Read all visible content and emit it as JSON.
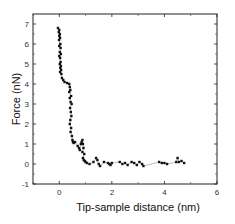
{
  "chart_data": {
    "type": "scatter",
    "title": "",
    "xlabel": "Tip-sample distance (nm)",
    "ylabel": "Force (nN)",
    "xlim": [
      -1,
      6
    ],
    "ylim": [
      -1,
      7.5
    ],
    "x_ticks": [
      0,
      2,
      4,
      6
    ],
    "x_minor_ticks": [
      -1,
      1,
      3,
      5
    ],
    "y_ticks": [
      -1,
      0,
      1,
      2,
      3,
      4,
      5,
      6,
      7
    ],
    "grid": false,
    "legend": null,
    "series": [
      {
        "name": "force-distance",
        "marker": "square",
        "line": "thin dotted connecting line",
        "x": [
          -0.05,
          0.0,
          -0.02,
          0.02,
          0.0,
          0.03,
          -0.01,
          0.04,
          0.0,
          0.05,
          0.02,
          0.06,
          0.0,
          0.03,
          0.05,
          0.02,
          0.06,
          0.04,
          0.07,
          0.03,
          0.08,
          0.1,
          0.15,
          0.2,
          0.3,
          0.38,
          0.4,
          0.42,
          0.38,
          0.45,
          0.4,
          0.43,
          0.47,
          0.41,
          0.44,
          0.46,
          0.42,
          0.4,
          0.45,
          0.43,
          0.48,
          0.5,
          0.52,
          0.55,
          0.6,
          0.7,
          0.75,
          0.78,
          0.82,
          0.85,
          0.88,
          0.9,
          0.92,
          0.88,
          0.95,
          0.9,
          0.93,
          0.97,
          1.0,
          1.05,
          1.15,
          1.3,
          1.4,
          1.45,
          1.5,
          1.55,
          1.7,
          1.85,
          1.9,
          1.95,
          2.0,
          2.3,
          2.4,
          2.5,
          2.6,
          2.75,
          2.85,
          2.95,
          3.05,
          3.15,
          3.2,
          3.8,
          3.9,
          4.0,
          4.1,
          4.45,
          4.5,
          4.55,
          4.65,
          4.75
        ],
        "y": [
          6.8,
          6.7,
          6.6,
          6.5,
          6.4,
          6.3,
          6.2,
          6.0,
          5.9,
          5.8,
          5.6,
          5.5,
          5.4,
          5.3,
          5.1,
          5.0,
          4.9,
          4.8,
          4.7,
          4.6,
          4.5,
          4.3,
          4.2,
          4.1,
          4.05,
          4.0,
          3.85,
          3.7,
          3.6,
          3.4,
          3.3,
          3.1,
          3.0,
          2.8,
          2.6,
          2.4,
          2.2,
          2.0,
          1.8,
          1.6,
          1.4,
          1.2,
          1.1,
          1.05,
          1.1,
          0.9,
          0.8,
          0.7,
          1.0,
          1.1,
          1.2,
          1.0,
          0.8,
          0.6,
          0.5,
          0.3,
          0.2,
          0.15,
          0.1,
          0.05,
          0.0,
          0.1,
          0.3,
          0.2,
          0.0,
          -0.1,
          0.1,
          0.05,
          0.0,
          -0.05,
          0.05,
          0.1,
          0.0,
          0.05,
          -0.05,
          0.1,
          0.05,
          -0.05,
          0.1,
          0.0,
          -0.1,
          0.1,
          0.05,
          0.05,
          0.0,
          0.1,
          0.3,
          0.1,
          0.15,
          0.05
        ]
      }
    ]
  },
  "axes": {
    "xlabel": "Tip-sample distance (nm)",
    "ylabel": "Force (nN)",
    "x_tick_labels": [
      "0",
      "2",
      "4",
      "6"
    ],
    "y_tick_labels": [
      "-1",
      "0",
      "1",
      "2",
      "3",
      "4",
      "5",
      "6",
      "7"
    ]
  }
}
